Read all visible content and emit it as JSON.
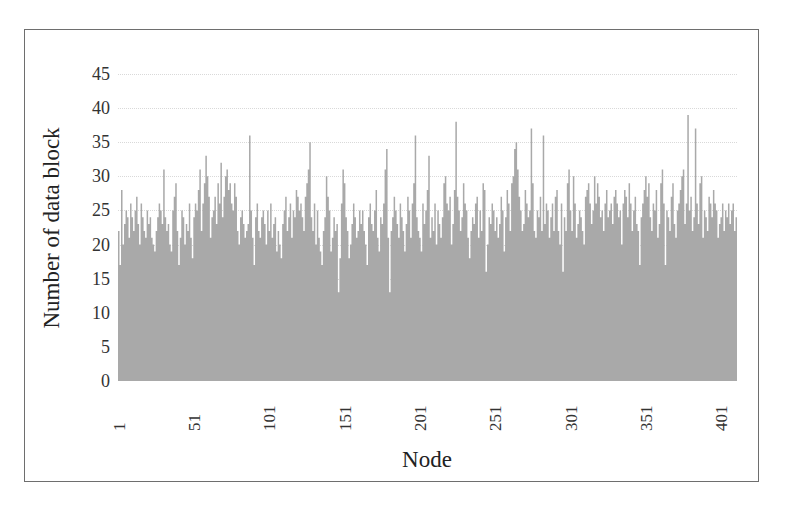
{
  "chart_data": {
    "type": "bar",
    "title": "",
    "xlabel": "Node",
    "ylabel": "Number of data block",
    "ylim": [
      0,
      45
    ],
    "yticks": [
      0,
      5,
      10,
      15,
      20,
      25,
      30,
      35,
      40,
      45
    ],
    "xticks": [
      1,
      51,
      101,
      151,
      201,
      251,
      301,
      351,
      401
    ],
    "grid": true,
    "legend": null,
    "bar_color": "#a9a9a9",
    "node_count": 432,
    "x_range": [
      1,
      432
    ],
    "values": [
      22,
      17,
      28,
      20,
      23,
      25,
      24,
      21,
      26,
      24,
      22,
      25,
      27,
      23,
      20,
      26,
      24,
      22,
      21,
      25,
      23,
      24,
      21,
      20,
      19,
      22,
      24,
      26,
      25,
      23,
      31,
      24,
      22,
      23,
      20,
      19,
      25,
      27,
      29,
      22,
      17,
      21,
      25,
      24,
      20,
      23,
      22,
      26,
      21,
      18,
      24,
      26,
      25,
      28,
      31,
      22,
      26,
      29,
      33,
      30,
      27,
      21,
      24,
      25,
      27,
      23,
      29,
      26,
      32,
      24,
      27,
      30,
      31,
      28,
      29,
      26,
      25,
      29,
      27,
      22,
      20,
      24,
      25,
      23,
      21,
      22,
      23,
      36,
      25,
      21,
      17,
      24,
      26,
      22,
      21,
      24,
      25,
      23,
      20,
      25,
      22,
      26,
      21,
      23,
      24,
      19,
      22,
      20,
      18,
      23,
      25,
      27,
      22,
      24,
      26,
      21,
      25,
      24,
      28,
      27,
      25,
      26,
      24,
      22,
      27,
      29,
      31,
      35,
      24,
      22,
      26,
      20,
      25,
      21,
      19,
      17,
      22,
      24,
      30,
      27,
      25,
      19,
      21,
      24,
      22,
      23,
      13,
      18,
      26,
      31,
      29,
      24,
      22,
      18,
      20,
      23,
      26,
      24,
      21,
      22,
      25,
      23,
      25,
      22,
      20,
      17,
      24,
      26,
      23,
      22,
      25,
      28,
      21,
      19,
      24,
      23,
      26,
      31,
      34,
      21,
      13,
      22,
      24,
      27,
      25,
      23,
      21,
      26,
      24,
      22,
      19,
      23,
      27,
      25,
      21,
      26,
      29,
      36,
      24,
      22,
      21,
      19,
      26,
      23,
      25,
      28,
      33,
      21,
      24,
      22,
      26,
      20,
      25,
      23,
      21,
      24,
      29,
      30,
      26,
      25,
      27,
      20,
      23,
      28,
      38,
      27,
      25,
      22,
      24,
      29,
      26,
      25,
      21,
      18,
      22,
      24,
      23,
      26,
      27,
      21,
      25,
      22,
      29,
      28,
      16,
      20,
      24,
      23,
      26,
      25,
      22,
      24,
      21,
      23,
      27,
      25,
      19,
      24,
      28,
      26,
      22,
      29,
      30,
      34,
      35,
      31,
      27,
      25,
      22,
      23,
      28,
      26,
      24,
      25,
      37,
      29,
      22,
      21,
      25,
      24,
      27,
      22,
      36,
      23,
      26,
      25,
      21,
      24,
      26,
      22,
      27,
      28,
      22,
      20,
      26,
      16,
      24,
      22,
      29,
      31,
      25,
      22,
      30,
      26,
      21,
      23,
      25,
      24,
      22,
      20,
      27,
      28,
      29,
      26,
      23,
      25,
      30,
      26,
      29,
      27,
      24,
      25,
      22,
      26,
      28,
      24,
      25,
      26,
      23,
      27,
      28,
      26,
      24,
      25,
      20,
      26,
      28,
      27,
      24,
      29,
      26,
      22,
      25,
      27,
      23,
      22,
      17,
      24,
      26,
      28,
      30,
      27,
      29,
      24,
      22,
      26,
      25,
      28,
      21,
      23,
      29,
      31,
      26,
      17,
      25,
      24,
      22,
      27,
      29,
      23,
      21,
      25,
      26,
      28,
      30,
      31,
      23,
      26,
      39,
      25,
      27,
      22,
      24,
      37,
      26,
      23,
      29,
      30,
      21,
      25,
      24,
      22,
      27,
      26,
      24,
      28,
      26,
      25,
      21,
      23,
      24,
      26,
      22,
      25,
      24,
      26,
      23,
      25,
      26,
      22,
      24
    ]
  }
}
